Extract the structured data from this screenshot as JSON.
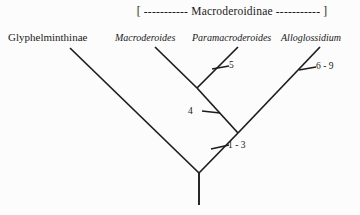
{
  "diagram": {
    "type": "cladogram",
    "title_bracket": "[ ----------- Macroderoidinae ----------- ]",
    "subfamily_bracket_taxon": "Macroderoidinae",
    "taxa": [
      {
        "id": "glyphelminthinae",
        "label": "Glyphelminthinae",
        "style": "roman",
        "rank": "subfamily"
      },
      {
        "id": "macroderoides",
        "label": "Macroderoides",
        "style": "italic",
        "rank": "genus"
      },
      {
        "id": "paramacroderoides",
        "label": "Paramacroderoides",
        "style": "italic",
        "rank": "genus"
      },
      {
        "id": "alloglossidium",
        "label": "Alloglossidium",
        "style": "italic",
        "rank": "genus"
      }
    ],
    "character_marks": [
      {
        "id": "mark-5",
        "label": "5",
        "on_branch": "paramacroderoides"
      },
      {
        "id": "mark-6-9",
        "label": "6 - 9",
        "on_branch": "alloglossidium"
      },
      {
        "id": "mark-4",
        "label": "4",
        "on_branch": "macroderoides-paramacroderoides-clade"
      },
      {
        "id": "mark-1-3",
        "label": "1 - 3",
        "on_branch": "macroderoidinae-clade"
      }
    ],
    "colors": {
      "background": "#fcfcfc",
      "line": "#1d1d1d",
      "text": "#1a1a1a"
    }
  }
}
